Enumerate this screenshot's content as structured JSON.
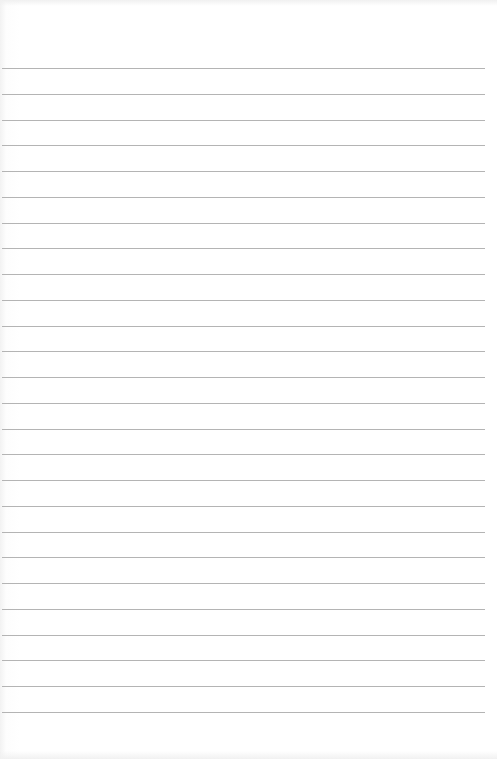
{
  "paper": {
    "type": "ruled-paper",
    "background": "#ffffff",
    "rule_color": "#b4b4b4",
    "first_rule_y": 68,
    "rule_spacing": 25.76,
    "rule_count": 26,
    "rule_left": 2,
    "rule_width": 483
  }
}
